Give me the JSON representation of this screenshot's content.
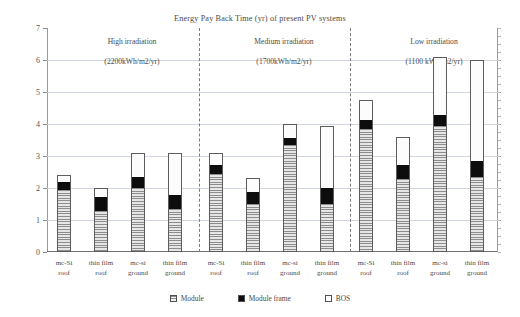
{
  "chart_data": {
    "type": "bar",
    "title": "Energy Pay Back Time (yr) of present PV systems",
    "xlabel": "",
    "ylabel": "",
    "ylim": [
      0,
      7
    ],
    "yticks": [
      0,
      1,
      2,
      3,
      4,
      5,
      6,
      7
    ],
    "grid": true,
    "legend_position": "bottom",
    "stacked": true,
    "legend": [
      {
        "name": "Module",
        "pattern": "horizontal-hatch",
        "color": "#d9d9d9"
      },
      {
        "name": "Module frame",
        "pattern": "solid",
        "color": "#0d0d0d"
      },
      {
        "name": "BOS",
        "pattern": "empty",
        "color": "#ffffff"
      }
    ],
    "groups": [
      {
        "name": "High irradiation",
        "sub": "(2200kWh/m2/yr)"
      },
      {
        "name": "Medium irradiation",
        "sub": "(1700kWh/m2/yr)"
      },
      {
        "name": "Low irradiation",
        "sub": "(1100 kWh/m2/yr)"
      }
    ],
    "categories": [
      "mc-Si roof",
      "thin film roof",
      "mc-si ground",
      "thin film ground",
      "mc-Si roof",
      "thin film roof",
      "mc-si ground",
      "thin film ground",
      "mc-Si roof",
      "thin film roof",
      "mc-si ground",
      "thin film ground"
    ],
    "series": [
      {
        "name": "Module",
        "values": [
          1.95,
          1.3,
          2.0,
          1.35,
          2.45,
          1.5,
          3.35,
          1.5,
          3.85,
          2.3,
          3.95,
          2.35
        ]
      },
      {
        "name": "Module frame",
        "values": [
          0.25,
          0.45,
          0.35,
          0.45,
          0.3,
          0.4,
          0.25,
          0.5,
          0.3,
          0.45,
          0.35,
          0.5
        ]
      },
      {
        "name": "BOS",
        "values": [
          0.2,
          0.25,
          0.75,
          1.3,
          0.35,
          0.4,
          0.4,
          1.95,
          0.6,
          0.85,
          1.8,
          3.15
        ]
      }
    ],
    "totals": [
      2.4,
      2.0,
      3.1,
      3.1,
      3.1,
      2.3,
      4.0,
      3.95,
      4.75,
      3.6,
      6.1,
      6.0
    ]
  },
  "axis": {
    "y_tick_labels": [
      "7",
      "6",
      "5",
      "4",
      "3",
      "2",
      "1",
      "0"
    ]
  },
  "bar_labels": [
    {
      "line1": "mc-Si",
      "line2": "roof"
    },
    {
      "line1": "thin film",
      "line2": "roof"
    },
    {
      "line1": "mc-si",
      "line2": "ground"
    },
    {
      "line1": "thin film",
      "line2": "ground"
    },
    {
      "line1": "mc-Si",
      "line2": "roof"
    },
    {
      "line1": "thin film",
      "line2": "roof"
    },
    {
      "line1": "mc-si",
      "line2": "ground"
    },
    {
      "line1": "thin film",
      "line2": "ground"
    },
    {
      "line1": "mc-Si",
      "line2": "roof"
    },
    {
      "line1": "thin film",
      "line2": "roof"
    },
    {
      "line1": "mc-si",
      "line2": "ground"
    },
    {
      "line1": "thin film",
      "line2": "ground"
    }
  ]
}
